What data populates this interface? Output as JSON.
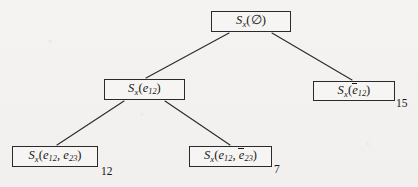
{
  "figure": {
    "type": "tree-diagram",
    "background_color": "#f3f2f0",
    "ink_color": "#171717"
  },
  "nodes": [
    {
      "id": "root",
      "label": "S_x(∅)",
      "base": "S",
      "subscript": "x",
      "args": "∅",
      "weight": "",
      "level": 0
    },
    {
      "id": "e12",
      "label": "S_x(e_12)",
      "base": "S",
      "subscript": "x",
      "args": "e_12",
      "weight": "",
      "level": 1
    },
    {
      "id": "e12bar",
      "label": "S_x(ē_12)",
      "base": "S",
      "subscript": "x",
      "args": "ē_12",
      "weight": "15",
      "level": 1
    },
    {
      "id": "e12-e23",
      "label": "S_x(e_12, e_23)",
      "base": "S",
      "subscript": "x",
      "args": "e_12, e_23",
      "weight": "12",
      "level": 2
    },
    {
      "id": "e12-e23bar",
      "label": "S_x(e_12, ē_23)",
      "base": "S",
      "subscript": "x",
      "args": "e_12, ē_23",
      "weight": "7",
      "level": 2
    }
  ],
  "node_text": {
    "root": {
      "s": "S",
      "x": "x",
      "open": "(",
      "a1": "∅",
      "close": ")"
    },
    "e12": {
      "s": "S",
      "x": "x",
      "open": "(",
      "e": "e",
      "sub": "12",
      "close": ")"
    },
    "e12bar": {
      "s": "S",
      "x": "x",
      "open": "(",
      "e": "e",
      "sub": "12",
      "close": ")"
    },
    "e12_e23": {
      "s": "S",
      "x": "x",
      "open": "(",
      "e1": "e",
      "sub1": "12",
      "comma": ", ",
      "e2": "e",
      "sub2": "23",
      "close": ")"
    },
    "e12_e23bar": {
      "s": "S",
      "x": "x",
      "open": "(",
      "e1": "e",
      "sub1": "12",
      "comma": ", ",
      "e2": "e",
      "sub2": "23",
      "close": ")"
    }
  },
  "weights": {
    "e12bar": "15",
    "e12_e23": "12",
    "e12_e23bar": "7"
  },
  "edges": [
    {
      "from": "root",
      "to": "e12"
    },
    {
      "from": "root",
      "to": "e12bar"
    },
    {
      "from": "e12",
      "to": "e12-e23"
    },
    {
      "from": "e12",
      "to": "e12-e23bar"
    }
  ]
}
